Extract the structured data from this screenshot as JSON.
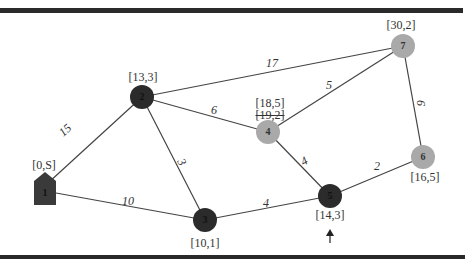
{
  "diagram": {
    "type": "weighted-graph-dijkstra",
    "colors": {
      "visited_node": "#2b2b2b",
      "tentative_node": "#a9a9a9",
      "edge": "#444444",
      "rule": "#2a2a2a"
    },
    "nodes": [
      {
        "id": "1",
        "label": "1",
        "state": "source",
        "shape": "house",
        "x": 45,
        "y": 190,
        "distance_labels": [
          "[0,S]"
        ],
        "label_pos": [
          44,
          165
        ]
      },
      {
        "id": "2",
        "label": "2",
        "state": "visited",
        "x": 142,
        "y": 97,
        "distance_labels": [
          "[13,3]"
        ],
        "label_pos": [
          143,
          77
        ]
      },
      {
        "id": "3",
        "label": "3",
        "state": "visited",
        "x": 205,
        "y": 220,
        "distance_labels": [
          "[10,1]"
        ],
        "label_pos": [
          205,
          243
        ]
      },
      {
        "id": "4",
        "label": "4",
        "state": "tentative",
        "x": 268,
        "y": 132,
        "distance_labels": [
          "[18,5]",
          "[19,2]"
        ],
        "struck_label": "[19,2]",
        "label_pos": [
          270,
          103
        ]
      },
      {
        "id": "5",
        "label": "5",
        "state": "visited",
        "x": 330,
        "y": 196,
        "distance_labels": [
          "[14,3]"
        ],
        "label_pos": [
          330,
          215
        ],
        "current": true
      },
      {
        "id": "6",
        "label": "6",
        "state": "tentative",
        "x": 423,
        "y": 157,
        "distance_labels": [
          "[16,5]"
        ],
        "label_pos": [
          425,
          177
        ]
      },
      {
        "id": "7",
        "label": "7",
        "state": "tentative",
        "x": 403,
        "y": 46,
        "distance_labels": [
          "[30,2]"
        ],
        "label_pos": [
          401,
          25
        ]
      }
    ],
    "edges": [
      {
        "from": "1",
        "to": "2",
        "weight": "15",
        "label_pos": [
          65,
          130
        ]
      },
      {
        "from": "1",
        "to": "3",
        "weight": "10",
        "label_pos": [
          128,
          201
        ]
      },
      {
        "from": "2",
        "to": "3",
        "weight": "3",
        "label_pos": [
          182,
          162
        ]
      },
      {
        "from": "2",
        "to": "4",
        "weight": "6",
        "label_pos": [
          214,
          110
        ]
      },
      {
        "from": "2",
        "to": "7",
        "weight": "17",
        "label_pos": [
          272,
          63
        ]
      },
      {
        "from": "4",
        "to": "7",
        "weight": "5",
        "label_pos": [
          329,
          85
        ]
      },
      {
        "from": "4",
        "to": "5",
        "weight": "4",
        "label_pos": [
          304,
          161
        ]
      },
      {
        "from": "3",
        "to": "5",
        "weight": "4",
        "label_pos": [
          266,
          203
        ]
      },
      {
        "from": "5",
        "to": "6",
        "weight": "2",
        "label_pos": [
          377,
          166
        ]
      },
      {
        "from": "7",
        "to": "6",
        "weight": "6",
        "label_pos": [
          421,
          103
        ]
      }
    ],
    "current_node_marker": {
      "symbol": "arrow-up",
      "x": 330,
      "y": 238
    }
  },
  "labels": {
    "n1": "[0,S]",
    "n2": "[13,3]",
    "n3": "[10,1]",
    "n4a": "[18,5]",
    "n4b": "[19,2]",
    "n5": "[14,3]",
    "n6": "[16,5]",
    "n7": "[30,2]",
    "id1": "1",
    "id2": "2",
    "id3": "3",
    "id4": "4",
    "id5": "5",
    "id6": "6",
    "id7": "7",
    "w12": "15",
    "w13": "10",
    "w23": "3",
    "w24": "6",
    "w27": "17",
    "w47": "5",
    "w45": "4",
    "w35": "4",
    "w56": "2",
    "w76": "6"
  }
}
